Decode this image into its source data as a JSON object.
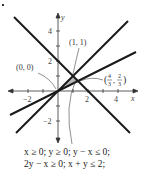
{
  "figure": {
    "axes": {
      "x_label": "x",
      "y_label": "y",
      "x_ticks": [
        "-2",
        "2",
        "4"
      ],
      "y_ticks": [
        "4",
        "2",
        "-2"
      ]
    },
    "points": [
      {
        "label": "(0, 0)",
        "x": 0,
        "y": 0
      },
      {
        "label": "(1, 1)",
        "x": 1,
        "y": 1
      },
      {
        "label": "(4/3, 2/3)",
        "x": 1.3333,
        "y": 0.6667,
        "num_x": "4",
        "den_x": "3",
        "num_y": "2",
        "den_y": "3"
      }
    ],
    "lines": [
      {
        "equation": "y = x"
      },
      {
        "equation": "2y - x = 0"
      },
      {
        "equation": "x + y = 2"
      }
    ],
    "constraints": {
      "line1": "x ≥ 0; y ≥ 0; y − x ≤ 0;",
      "line2": "2y − x ≥ 0; x + y ≤ 2;"
    },
    "colors": {
      "line": "#1a1a1a",
      "region": "#b8b8b8",
      "axis": "#333333"
    }
  }
}
